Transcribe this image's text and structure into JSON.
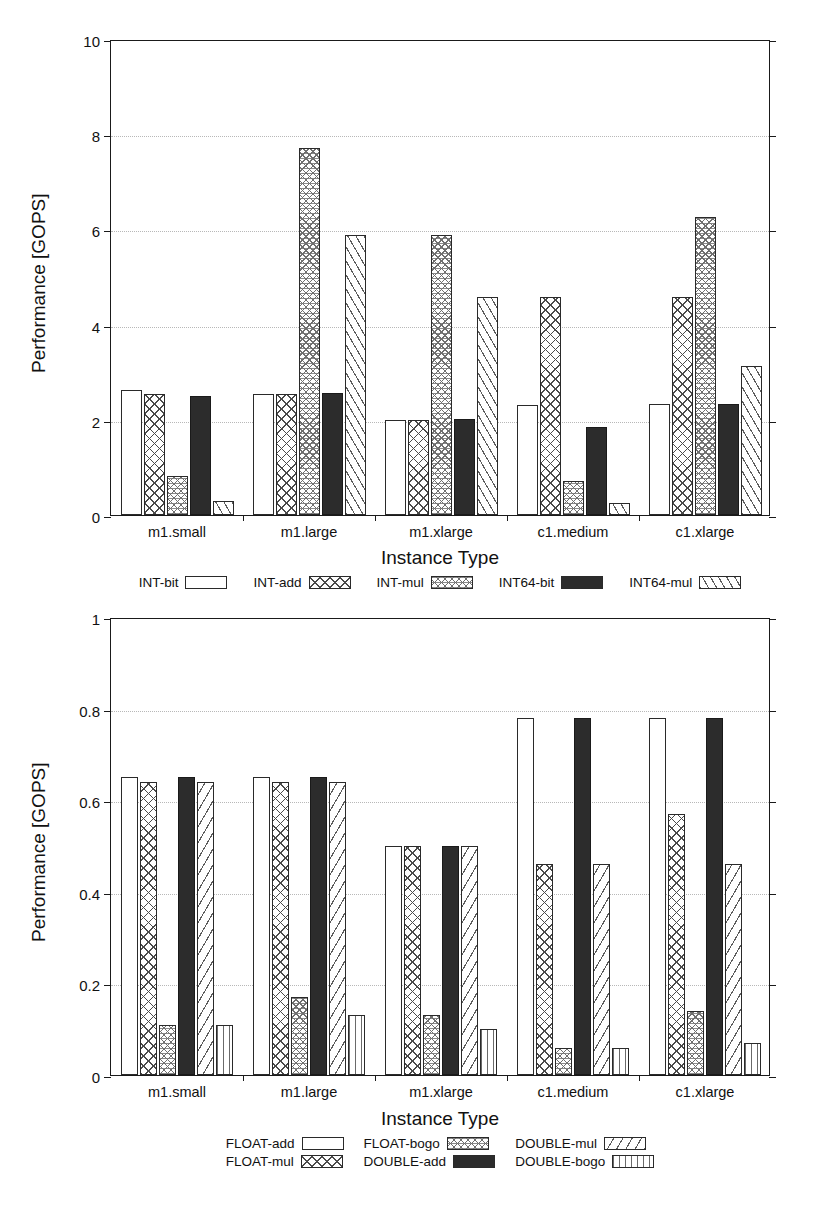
{
  "figure": {
    "background": "#ffffff",
    "axis_color": "#1a1a1a",
    "grid_color": "#b8b8b8"
  },
  "charts": [
    {
      "id": "integer-performance-chart",
      "xlabel": "Instance Type",
      "ylabel": "Performance [GOPS]",
      "yticks": [
        "0",
        "2",
        "4",
        "6",
        "8",
        "10"
      ],
      "categories": [
        "m1.small",
        "m1.large",
        "m1.xlarge",
        "c1.medium",
        "c1.xlarge"
      ],
      "legend": [
        {
          "label": "INT-bit",
          "pattern": "pat-empty"
        },
        {
          "label": "INT-add",
          "pattern": "pat-cross"
        },
        {
          "label": "INT-mul",
          "pattern": "pat-dots"
        },
        {
          "label": "INT64-bit",
          "pattern": "pat-solid"
        },
        {
          "label": "INT64-mul",
          "pattern": "pat-diag"
        }
      ]
    },
    {
      "id": "float-performance-chart",
      "xlabel": "Instance Type",
      "ylabel": "Performance [GOPS]",
      "yticks": [
        "0",
        "0.2",
        "0.4",
        "0.6",
        "0.8",
        "1"
      ],
      "categories": [
        "m1.small",
        "m1.large",
        "m1.xlarge",
        "c1.medium",
        "c1.xlarge"
      ],
      "legend": [
        {
          "label": "FLOAT-add",
          "pattern": "pat-empty"
        },
        {
          "label": "FLOAT-bogo",
          "pattern": "pat-dots"
        },
        {
          "label": "DOUBLE-mul",
          "pattern": "pat-diag2"
        },
        {
          "label": "FLOAT-mul",
          "pattern": "pat-cross"
        },
        {
          "label": "DOUBLE-add",
          "pattern": "pat-solid"
        },
        {
          "label": "DOUBLE-bogo",
          "pattern": "pat-vert"
        }
      ]
    }
  ],
  "chart_data": [
    {
      "type": "bar",
      "title": "",
      "xlabel": "Instance Type",
      "ylabel": "Performance [GOPS]",
      "ylim": [
        0,
        10
      ],
      "yticks": [
        0,
        2,
        4,
        6,
        8,
        10
      ],
      "grid": true,
      "legend_position": "below",
      "categories": [
        "m1.small",
        "m1.large",
        "m1.xlarge",
        "c1.medium",
        "c1.xlarge"
      ],
      "series": [
        {
          "name": "INT-bit",
          "pattern": "empty",
          "values": [
            2.62,
            2.54,
            2.0,
            2.31,
            2.33
          ]
        },
        {
          "name": "INT-add",
          "pattern": "crosshatch",
          "values": [
            2.55,
            2.54,
            2.0,
            4.57,
            4.57
          ]
        },
        {
          "name": "INT-mul",
          "pattern": "dotted",
          "values": [
            0.83,
            7.7,
            5.89,
            0.72,
            6.27
          ]
        },
        {
          "name": "INT64-bit",
          "pattern": "solid-black",
          "values": [
            2.5,
            2.57,
            2.01,
            1.84,
            2.33
          ]
        },
        {
          "name": "INT64-mul",
          "pattern": "diagonal",
          "values": [
            0.3,
            5.89,
            4.57,
            0.25,
            3.14
          ]
        }
      ]
    },
    {
      "type": "bar",
      "title": "",
      "xlabel": "Instance Type",
      "ylabel": "Performance [GOPS]",
      "ylim": [
        0,
        1
      ],
      "yticks": [
        0,
        0.2,
        0.4,
        0.6,
        0.8,
        1
      ],
      "grid": true,
      "legend_position": "below",
      "categories": [
        "m1.small",
        "m1.large",
        "m1.xlarge",
        "c1.medium",
        "c1.xlarge"
      ],
      "series": [
        {
          "name": "FLOAT-add",
          "pattern": "empty",
          "values": [
            0.65,
            0.65,
            0.5,
            0.78,
            0.78
          ]
        },
        {
          "name": "FLOAT-mul",
          "pattern": "crosshatch",
          "values": [
            0.64,
            0.64,
            0.5,
            0.46,
            0.57
          ]
        },
        {
          "name": "FLOAT-bogo",
          "pattern": "dotted",
          "values": [
            0.11,
            0.17,
            0.13,
            0.06,
            0.14
          ]
        },
        {
          "name": "DOUBLE-add",
          "pattern": "solid-black",
          "values": [
            0.65,
            0.65,
            0.5,
            0.78,
            0.78
          ]
        },
        {
          "name": "DOUBLE-mul",
          "pattern": "diagonal",
          "values": [
            0.64,
            0.64,
            0.5,
            0.46,
            0.46
          ]
        },
        {
          "name": "DOUBLE-bogo",
          "pattern": "vertical",
          "values": [
            0.11,
            0.13,
            0.1,
            0.06,
            0.07
          ]
        }
      ]
    }
  ]
}
